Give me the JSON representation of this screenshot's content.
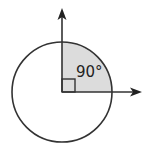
{
  "diagram": {
    "type": "angle-diagram",
    "angle_label": "90°",
    "colors": {
      "stroke": "#333333",
      "sector_fill": "#dcdcdc",
      "background": "#ffffff"
    },
    "center": [
      62,
      92
    ],
    "radius": 50,
    "elements": [
      {
        "name": "circle"
      },
      {
        "name": "shaded-quarter-sector",
        "from_deg": 0,
        "to_deg": 90
      },
      {
        "name": "vertical-arrow",
        "direction": "up"
      },
      {
        "name": "horizontal-arrow",
        "direction": "right"
      },
      {
        "name": "right-angle-marker"
      }
    ]
  }
}
